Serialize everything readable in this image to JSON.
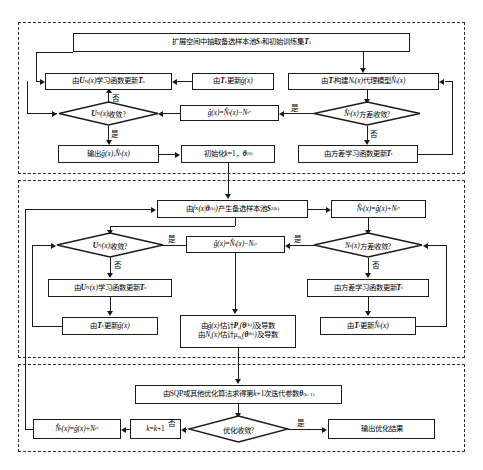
{
  "diagram": {
    "sections": [
      {
        "id": "stage-1",
        "name": "初始代理模型构建阶段"
      },
      {
        "id": "stage-2",
        "name": "迭代更新阶段"
      },
      {
        "id": "stage-3",
        "name": "优化求解阶段"
      }
    ],
    "branch_labels": {
      "yes": "是",
      "no": "否"
    }
  },
  "nodes": {
    "start_box": "扩展空间中抽取备选样本池S₁和初始训练集T₁",
    "s1_update_ts": "由U_N(x)学习函数更新T_s",
    "s1_update_g": "由T_s更新ĝ(x)",
    "s1_build_surrogate": "由T_t构建N_t(x)代理模型N̂_t(x)",
    "s1_diamond_un": "U_N(x)收敛?",
    "s1_ghat_def": "ĝ(x)=N̂_t(x)−N*_t",
    "s1_diamond_var": "N̂_t(x)方差收敛?",
    "s1_output": "输出ĝ(x), N̂_t(x)",
    "s1_init": "初始化k=1，θ⁽⁰⁾",
    "s1_var_update_tt": "由方差学习函数更新T_t",
    "s2_sample_pool": "由f_X(x|θ⁽ᵏ⁾)产生备选样本池S₂⁽ᵏ⁾",
    "s2_nhat_def": "N̂_t(x)=ĝ(x)+N*_t",
    "s2_diamond_un": "U_N(x)收敛?",
    "s2_ghat_def": "ĝ(x)=N̂_t(x)−N*_t",
    "s2_diamond_var": "N_t(x)方差收敛?",
    "s2_update_ts": "由U_N(x)学习函数更新T_s",
    "s2_var_update_tt": "由方差学习函数更新T_t",
    "s2_update_g": "由T_s更新ĝ(x)",
    "s2_estimate_line1": "由ĝ(x)估计P_f(θ⁽ᵏ⁾)及导数",
    "s2_estimate_line2": "由N_t(x)估计μ_N_t(θ⁽ᵏ⁾)及导数",
    "s2_update_nhat": "由T_t更新N̂_t(x)",
    "s3_sqp": "由SQP或其他优化算法求得第k+1次迭代参数θ⁽ᵏ⁺¹⁾",
    "s3_nhat_def": "N̂_t(x)=ĝ(x)+N*_t",
    "s3_increment": "k=k+1",
    "s3_diamond": "优化收敛?",
    "s3_output": "输出优化结果"
  },
  "colors": {
    "stroke": "#1a1a1a",
    "dashed_border": "#2b2b2b",
    "background": "#ffffff",
    "text": "#000000"
  }
}
